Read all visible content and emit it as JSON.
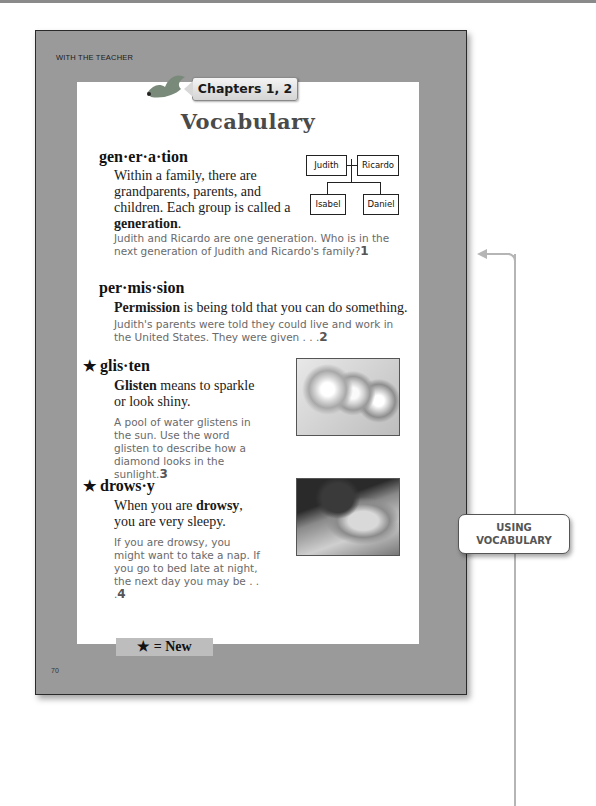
{
  "header": {
    "section_label": "WITH THE TEACHER",
    "chapter_tab": "Chapters 1, 2",
    "title": "Vocabulary"
  },
  "entries": [
    {
      "headword": "gen·er·a·tion",
      "is_new": false,
      "definition_pre": "Within a family, there are grandparents, parents, and children.  Each group is called a ",
      "definition_bold": "generation",
      "definition_post": ".",
      "example": "Judith and Ricardo are one generation.  Who is in the next generation of Judith and Ricardo's family?",
      "question_number": "1",
      "diagram": {
        "parents": [
          "Judith",
          "Ricardo"
        ],
        "children": [
          "Isabel",
          "Daniel"
        ]
      }
    },
    {
      "headword": "per·mis·sion",
      "is_new": false,
      "definition_bold": "Permission",
      "definition_post": " is being told that you can do something.",
      "example": "Judith's parents were told they could live and work in the United States.  They were given . . .",
      "question_number": "2"
    },
    {
      "headword": "glis·ten",
      "is_new": true,
      "definition_bold": "Glisten",
      "definition_post": " means to sparkle or look shiny.",
      "example": "A pool of water glistens in the sun.  Use the word glisten to describe how a diamond looks in the sunlight.",
      "question_number": "3",
      "image": "diamonds-photo"
    },
    {
      "headword": "drows·y",
      "is_new": true,
      "definition_pre": "When you are ",
      "definition_bold": "drowsy",
      "definition_post": ", you are very sleepy.",
      "example": "If you are drowsy, you might want to take a nap.  If you go to bed late at night, the next day you may be . . .",
      "question_number": "4",
      "image": "sleeping-child-photo"
    }
  ],
  "legend": {
    "star": "★",
    "label": "★ = New"
  },
  "footer": {
    "page_number": "70"
  },
  "margin_note": {
    "line1": "USING",
    "line2": "VOCABULARY"
  }
}
